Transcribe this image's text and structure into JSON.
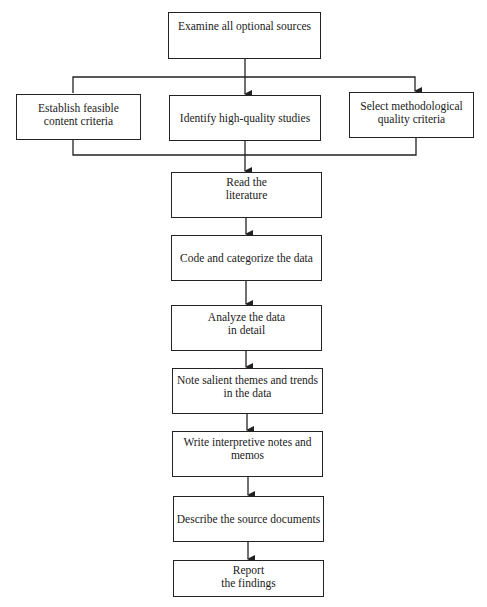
{
  "diagram": {
    "type": "flowchart",
    "nodes": [
      {
        "id": "examine",
        "label": "Examine all optional sources"
      },
      {
        "id": "content_criteria",
        "label": "Establish feasible\ncontent criteria"
      },
      {
        "id": "high_quality",
        "label": "Identify high-quality studies"
      },
      {
        "id": "method_criteria",
        "label": "Select methodological\nquality criteria"
      },
      {
        "id": "read",
        "label": "Read the\nliterature"
      },
      {
        "id": "code",
        "label": "Code and categorize the data"
      },
      {
        "id": "analyze",
        "label": "Analyze the data\nin detail"
      },
      {
        "id": "note",
        "label": "Note salient themes and trends\nin the data"
      },
      {
        "id": "write",
        "label": "Write interpretive notes and\nmemos"
      },
      {
        "id": "describe",
        "label": "Describe the source documents"
      },
      {
        "id": "report",
        "label": "Report\nthe findings"
      }
    ],
    "edges": [
      [
        "examine",
        "content_criteria"
      ],
      [
        "examine",
        "high_quality"
      ],
      [
        "examine",
        "method_criteria"
      ],
      [
        "content_criteria",
        "read"
      ],
      [
        "high_quality",
        "read"
      ],
      [
        "method_criteria",
        "read"
      ],
      [
        "read",
        "code"
      ],
      [
        "code",
        "analyze"
      ],
      [
        "analyze",
        "note"
      ],
      [
        "note",
        "write"
      ],
      [
        "write",
        "describe"
      ],
      [
        "describe",
        "report"
      ]
    ],
    "line_color": "#222222"
  }
}
